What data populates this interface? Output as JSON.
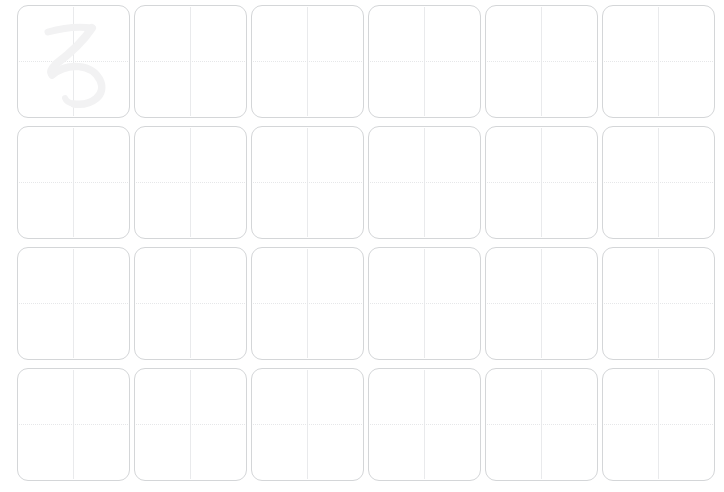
{
  "worksheet": {
    "type": "hiragana-handwriting-practice-sheet",
    "title": "Hiragana Writing Practice",
    "background_color": "#ffffff",
    "width": 724,
    "height": 492,
    "character": "ろ",
    "character_romaji": "ro",
    "character_script": "hiragana",
    "grid": {
      "rows": 4,
      "columns": 6,
      "total_cells": 24,
      "cell_size_px": 113,
      "column_gap_px": 4,
      "row_gap_px": 8,
      "cell_border_color": "#d4d6d8",
      "cell_border_radius_px": 11,
      "guide_vertical_color": "#e9eaec",
      "guide_vertical_style": "solid",
      "guide_horizontal_color": "#e6e7e9",
      "guide_horizontal_style": "dotted",
      "trace_glyph_color": "#f2f2f3"
    },
    "cells": [
      {
        "row": 1,
        "column": 1,
        "glyph": "ろ",
        "traced": true,
        "filled": false,
        "label": "practice-cell-r1c1"
      },
      {
        "row": 1,
        "column": 2,
        "glyph": "",
        "traced": false,
        "filled": false,
        "label": "practice-cell-r1c2"
      },
      {
        "row": 1,
        "column": 3,
        "glyph": "",
        "traced": false,
        "filled": false,
        "label": "practice-cell-r1c3"
      },
      {
        "row": 1,
        "column": 4,
        "glyph": "",
        "traced": false,
        "filled": false,
        "label": "practice-cell-r1c4"
      },
      {
        "row": 1,
        "column": 5,
        "glyph": "",
        "traced": false,
        "filled": false,
        "label": "practice-cell-r1c5"
      },
      {
        "row": 1,
        "column": 6,
        "glyph": "",
        "traced": false,
        "filled": false,
        "label": "practice-cell-r1c6"
      },
      {
        "row": 2,
        "column": 1,
        "glyph": "",
        "traced": false,
        "filled": false,
        "label": "practice-cell-r2c1"
      },
      {
        "row": 2,
        "column": 2,
        "glyph": "",
        "traced": false,
        "filled": false,
        "label": "practice-cell-r2c2"
      },
      {
        "row": 2,
        "column": 3,
        "glyph": "",
        "traced": false,
        "filled": false,
        "label": "practice-cell-r2c3"
      },
      {
        "row": 2,
        "column": 4,
        "glyph": "",
        "traced": false,
        "filled": false,
        "label": "practice-cell-r2c4"
      },
      {
        "row": 2,
        "column": 5,
        "glyph": "",
        "traced": false,
        "filled": false,
        "label": "practice-cell-r2c5"
      },
      {
        "row": 2,
        "column": 6,
        "glyph": "",
        "traced": false,
        "filled": false,
        "label": "practice-cell-r2c6"
      },
      {
        "row": 3,
        "column": 1,
        "glyph": "",
        "traced": false,
        "filled": false,
        "label": "practice-cell-r3c1"
      },
      {
        "row": 3,
        "column": 2,
        "glyph": "",
        "traced": false,
        "filled": false,
        "label": "practice-cell-r3c2"
      },
      {
        "row": 3,
        "column": 3,
        "glyph": "",
        "traced": false,
        "filled": false,
        "label": "practice-cell-r3c3"
      },
      {
        "row": 3,
        "column": 4,
        "glyph": "",
        "traced": false,
        "filled": false,
        "label": "practice-cell-r3c4"
      },
      {
        "row": 3,
        "column": 5,
        "glyph": "",
        "traced": false,
        "filled": false,
        "label": "practice-cell-r3c5"
      },
      {
        "row": 3,
        "column": 6,
        "glyph": "",
        "traced": false,
        "filled": false,
        "label": "practice-cell-r3c6"
      },
      {
        "row": 4,
        "column": 1,
        "glyph": "",
        "traced": false,
        "filled": false,
        "label": "practice-cell-r4c1"
      },
      {
        "row": 4,
        "column": 2,
        "glyph": "",
        "traced": false,
        "filled": false,
        "label": "practice-cell-r4c2"
      },
      {
        "row": 4,
        "column": 3,
        "glyph": "",
        "traced": false,
        "filled": false,
        "label": "practice-cell-r4c3"
      },
      {
        "row": 4,
        "column": 4,
        "glyph": "",
        "traced": false,
        "filled": false,
        "label": "practice-cell-r4c4"
      },
      {
        "row": 4,
        "column": 5,
        "glyph": "",
        "traced": false,
        "filled": false,
        "label": "practice-cell-r4c5"
      },
      {
        "row": 4,
        "column": 6,
        "glyph": "",
        "traced": false,
        "filled": false,
        "label": "practice-cell-r4c6"
      }
    ]
  }
}
